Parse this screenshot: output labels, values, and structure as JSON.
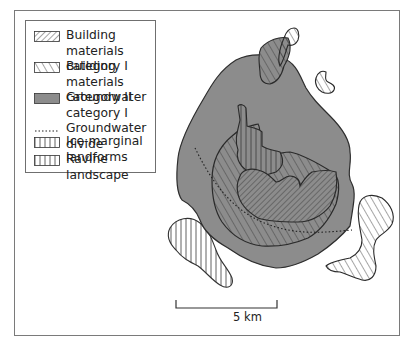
{
  "legend": {
    "items": [
      {
        "id": "building-materials-1",
        "label": "Building materials\ncategory I",
        "pattern": "dense-diagonal-hatch"
      },
      {
        "id": "building-materials-2",
        "label": "Building materials\ncategory II",
        "pattern": "sparse-diagonal-hatch"
      },
      {
        "id": "groundwater-1",
        "label": "Groundwater\ncategory I",
        "pattern": "solid-grey"
      },
      {
        "id": "groundwater-divide",
        "label": "Groundwater\ndivide",
        "pattern": "dotted-line"
      },
      {
        "id": "ravine-landscape",
        "label": "Ravine landscape",
        "pattern": "vertical-hatch"
      },
      {
        "id": "ice-marginal",
        "label": "Ice-marginal\nlandforms",
        "pattern": "vertical-hatch"
      }
    ]
  },
  "scalebar": {
    "label": "5 km"
  },
  "colors": {
    "groundwater_fill": "#8c8c8c",
    "outline": "#333333",
    "hatch": "#444444",
    "frame": "#7a7a7a"
  }
}
